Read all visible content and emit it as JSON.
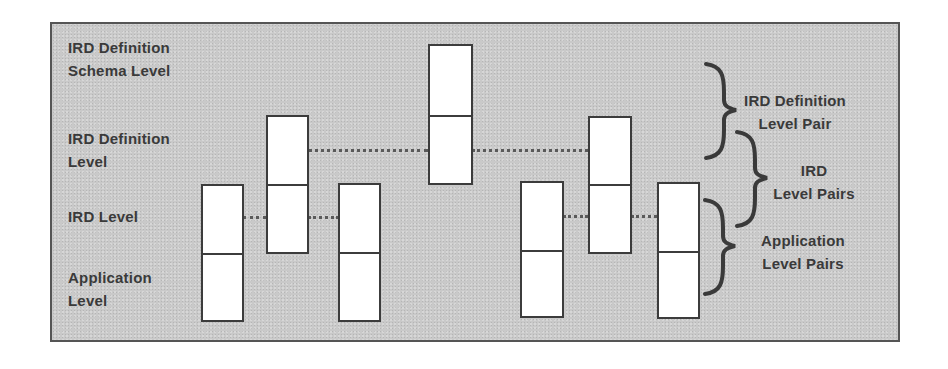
{
  "diagram": {
    "left_labels": [
      {
        "id": "schema",
        "text": "IRD Definition\nSchema Level"
      },
      {
        "id": "def",
        "text": "IRD Definition\nLevel"
      },
      {
        "id": "ird",
        "text": "IRD Level"
      },
      {
        "id": "app",
        "text": "Application\nLevel"
      }
    ],
    "right_labels": [
      {
        "id": "def-pair",
        "text": "IRD Definition\nLevel Pair"
      },
      {
        "id": "ird-pairs",
        "text": "IRD\nLevel Pairs"
      },
      {
        "id": "app-pairs",
        "text": "Application\nLevel Pairs"
      }
    ],
    "colors": {
      "background": "#c9c9c9",
      "box_fill": "#ffffff",
      "box_border": "#3c3c3c",
      "text": "#3a3a3a",
      "dotted_line": "#5a5a5a"
    }
  }
}
